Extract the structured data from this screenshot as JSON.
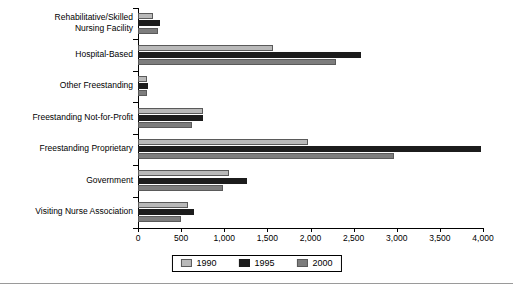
{
  "chart_data": {
    "type": "bar",
    "orientation": "horizontal",
    "title": "",
    "subtitle": "",
    "xlabel": "",
    "ylabel": "",
    "xlim": [
      0,
      4000
    ],
    "xticks": [
      0,
      500,
      1000,
      1500,
      2000,
      2500,
      3000,
      3500,
      4000
    ],
    "xtick_labels": [
      "0",
      "500",
      "1,000",
      "1,500",
      "2,000",
      "2,500",
      "3,000",
      "3,500",
      "4,000"
    ],
    "grid": false,
    "legend_position": "bottom-center",
    "categories": [
      "Rehabilitative/Skilled\nNursing Facility",
      "Hospital-Based",
      "Other Freestanding",
      "Freestanding Not-for-Profit",
      "Freestanding Proprietary",
      "Government",
      "Visiting Nurse Association"
    ],
    "series": [
      {
        "name": "1990",
        "color": "#b9b9b9",
        "values": [
          170,
          1560,
          110,
          750,
          1970,
          1060,
          580
        ]
      },
      {
        "name": "1995",
        "color": "#1c1c1c",
        "values": [
          260,
          2590,
          120,
          750,
          3980,
          1260,
          650
        ]
      },
      {
        "name": "2000",
        "color": "#7d7d7d",
        "values": [
          230,
          2290,
          100,
          630,
          2970,
          980,
          500
        ]
      }
    ]
  },
  "legend": {
    "items": [
      {
        "label": "1990",
        "swatch": "y1990"
      },
      {
        "label": "1995",
        "swatch": "y1995"
      },
      {
        "label": "2000",
        "swatch": "y2000"
      }
    ]
  },
  "colors": {
    "series_1990": "#b9b9b9",
    "series_1995": "#1c1c1c",
    "series_2000": "#7d7d7d",
    "axis": "#000000",
    "background": "#ffffff",
    "rule": "#9a9a9a"
  }
}
